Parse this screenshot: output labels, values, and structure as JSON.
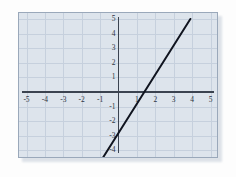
{
  "chart_data": {
    "type": "line",
    "title": "",
    "subtitle": "",
    "xlabel": "",
    "ylabel": "",
    "xlim": [
      -5,
      5
    ],
    "ylim": [
      -5,
      5
    ],
    "grid": true,
    "legend": null,
    "x_ticks": [
      -5,
      -4,
      -3,
      -2,
      -1,
      1,
      2,
      3,
      4,
      5
    ],
    "y_ticks": [
      5,
      4,
      3,
      2,
      1,
      -1,
      -2,
      -3,
      -4,
      -5
    ],
    "x_tick_labels": [
      "-5",
      "-4",
      "-3",
      "-2",
      "-1",
      "1",
      "2",
      "3",
      "4",
      "5"
    ],
    "y_tick_labels": [
      "5",
      "4",
      "3",
      "2",
      "1",
      "-1",
      "-2",
      "-3",
      "-4",
      "-5"
    ],
    "series": [
      {
        "name": "y = 2x - 3",
        "equation": "y = 2x - 3",
        "slope": 2,
        "y_intercept": -3,
        "x_intercept": 1.5,
        "color": "#10141f",
        "width": 2,
        "x": [
          -1,
          4
        ],
        "values": [
          -5,
          5
        ],
        "points": [
          {
            "x": -1,
            "y": -5
          },
          {
            "x": 0,
            "y": -3
          },
          {
            "x": 1.5,
            "y": 0
          },
          {
            "x": 2,
            "y": 1
          },
          {
            "x": 4,
            "y": 5
          }
        ]
      }
    ]
  },
  "style": {
    "panel_background": "#dde4ec",
    "panel_border": "#9aa8ba",
    "grid_color": "#c6d0dd",
    "axis_color": "#3b4350",
    "label_color": "#2d3442",
    "page_background": "#ffffff"
  }
}
